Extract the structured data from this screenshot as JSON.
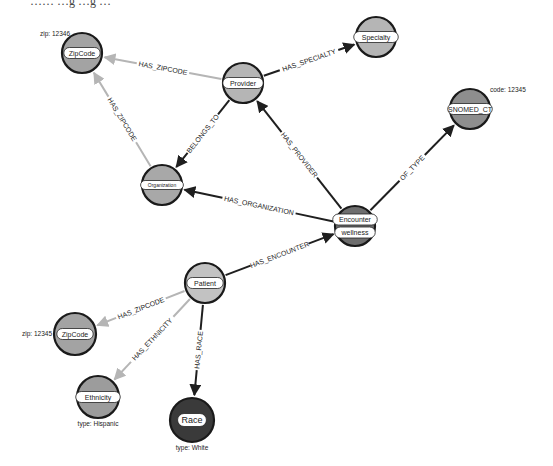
{
  "diagram": {
    "type": "graph",
    "top_cut_text": "……  …g  …g  …"
  },
  "colors": {
    "edge_dark": "#1f1f1f",
    "edge_light": "#b5b5b5",
    "node_light": "#b7b7b7",
    "node_mid": "#9c9c9c",
    "node_dark": "#6e6e6e",
    "node_black": "#3a3a3a"
  },
  "nodes": [
    {
      "id": "zipcode_top",
      "labels": [
        "ZipCode"
      ],
      "x": 82,
      "y": 53,
      "r": 20,
      "fill": "#a3a3a3",
      "prop": "zip: 12346",
      "prop_pos": "top-left"
    },
    {
      "id": "provider",
      "labels": [
        "Provider"
      ],
      "x": 243,
      "y": 83,
      "r": 20,
      "fill": "#b5b5b5",
      "prop": "",
      "prop_pos": ""
    },
    {
      "id": "specialty",
      "labels": [
        "Specialty"
      ],
      "x": 376,
      "y": 37,
      "r": 20,
      "fill": "#b5b5b5",
      "prop": "",
      "prop_pos": ""
    },
    {
      "id": "organization",
      "labels": [
        "Organization"
      ],
      "x": 162,
      "y": 185,
      "r": 20,
      "fill": "#a8a8a8",
      "prop": "",
      "prop_pos": ""
    },
    {
      "id": "snomed",
      "labels": [
        "SNOMED_CT"
      ],
      "x": 470,
      "y": 109,
      "r": 20,
      "fill": "#8e8e8e",
      "prop": "code: 12345",
      "prop_pos": "top-right"
    },
    {
      "id": "encounter",
      "labels": [
        "Encounter",
        "wellness"
      ],
      "x": 355,
      "y": 226,
      "r": 20,
      "fill": "#6e6e6e",
      "prop": "",
      "prop_pos": ""
    },
    {
      "id": "patient",
      "labels": [
        "Patient"
      ],
      "x": 205,
      "y": 283,
      "r": 20,
      "fill": "#c2c2c2",
      "prop": "",
      "prop_pos": ""
    },
    {
      "id": "zipcode_bottom",
      "labels": [
        "ZipCode"
      ],
      "x": 75,
      "y": 334,
      "r": 21,
      "fill": "#a3a3a3",
      "prop": "zip: 12345",
      "prop_pos": "left"
    },
    {
      "id": "ethnicity",
      "labels": [
        "Ethnicity"
      ],
      "x": 98,
      "y": 397,
      "r": 21,
      "fill": "#9c9c9c",
      "prop": "type: Hispanic",
      "prop_pos": "bottom"
    },
    {
      "id": "race",
      "labels": [
        "Race"
      ],
      "x": 192,
      "y": 420,
      "r": 22,
      "fill": "#3a3a3a",
      "prop": "type: White",
      "prop_pos": "bottom"
    }
  ],
  "edges": [
    {
      "from": "provider",
      "to": "zipcode_top",
      "label": "HAS_ZIPCODE",
      "style": "light"
    },
    {
      "from": "provider",
      "to": "specialty",
      "label": "HAS_SPECIALTY",
      "style": "dark"
    },
    {
      "from": "provider",
      "to": "organization",
      "label": "BELONGS_TO",
      "style": "dark"
    },
    {
      "from": "organization",
      "to": "zipcode_top",
      "label": "HAS_ZIPCODE",
      "style": "light"
    },
    {
      "from": "encounter",
      "to": "provider",
      "label": "HAS_PROVIDER",
      "style": "dark"
    },
    {
      "from": "encounter",
      "to": "organization",
      "label": "HAS_ORGANIZATION",
      "style": "dark"
    },
    {
      "from": "encounter",
      "to": "snomed",
      "label": "OF_TYPE",
      "style": "dark"
    },
    {
      "from": "patient",
      "to": "encounter",
      "label": "HAS_ENCOUNTER",
      "style": "dark"
    },
    {
      "from": "patient",
      "to": "zipcode_bottom",
      "label": "HAS_ZIPCODE",
      "style": "light"
    },
    {
      "from": "patient",
      "to": "ethnicity",
      "label": "HAS_ETHNICITY",
      "style": "light"
    },
    {
      "from": "patient",
      "to": "race",
      "label": "HAS_RACE",
      "style": "dark"
    }
  ]
}
